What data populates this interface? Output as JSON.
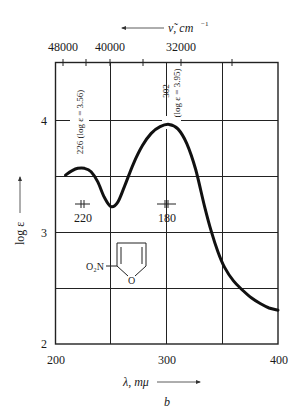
{
  "chart_data": {
    "type": "line",
    "title": "",
    "panel_label": "b",
    "xlabel": "λ, mμ",
    "ylabel": "log ε",
    "top_xlabel": "ν̃, cm⁻¹",
    "xlim": [
      200,
      400
    ],
    "ylim": [
      2,
      4.5
    ],
    "x_ticks": [
      200,
      300,
      400
    ],
    "x_gridlines": [
      250,
      300,
      350
    ],
    "y_ticks": [
      2,
      3,
      4
    ],
    "y_gridlines": [
      2.5,
      3,
      3.5,
      4
    ],
    "top_ticks_labeled": [
      {
        "label": "48000",
        "lambda": 208.3
      },
      {
        "label": "40000",
        "lambda": 250
      },
      {
        "label": "32000",
        "lambda": 312.5
      }
    ],
    "top_ticks_minor": [
      227.3,
      277.8,
      357.1
    ],
    "grid": true,
    "series": [
      {
        "name": "2-nitrofuran",
        "x": [
          209,
          215,
          220,
          226,
          232,
          238,
          244,
          250,
          256,
          262,
          270,
          278,
          286,
          294,
          302,
          310,
          318,
          326,
          334,
          340,
          346,
          352,
          360,
          368,
          376,
          384,
          392,
          400
        ],
        "y": [
          3.5,
          3.54,
          3.56,
          3.56,
          3.53,
          3.44,
          3.3,
          3.22,
          3.26,
          3.4,
          3.6,
          3.76,
          3.87,
          3.93,
          3.95,
          3.91,
          3.78,
          3.55,
          3.22,
          3.0,
          2.82,
          2.68,
          2.56,
          2.48,
          2.41,
          2.36,
          2.32,
          2.3
        ]
      }
    ],
    "annotations": [
      {
        "text": "226 (log ε = 3.56)",
        "x": 226,
        "y": 3.56,
        "rotation": -90
      },
      {
        "text": "302",
        "x": 302,
        "y": 3.95,
        "rotation": -90
      },
      {
        "text": "(log ε = 3.95)",
        "x": 302,
        "y": 3.95,
        "rotation": -90
      },
      {
        "text": "220",
        "x": 220,
        "y": 3.3,
        "note": "bandwidth marker"
      },
      {
        "text": "180",
        "x": 300,
        "y": 3.3,
        "note": "bandwidth marker"
      }
    ],
    "structure": {
      "substituent": "O₂N",
      "ring_atom": "O",
      "name": "2-nitrofuran"
    }
  },
  "labels": {
    "top_axis_title": "ν̃, cm",
    "top_axis_exp": "−1",
    "top_tick_48000": "48000",
    "top_tick_40000": "40000",
    "top_tick_32000": "32000",
    "y_tick_2": "2",
    "y_tick_3": "3",
    "y_tick_4": "4",
    "x_tick_200": "200",
    "x_tick_300": "300",
    "x_tick_400": "400",
    "ylabel": "log ε",
    "xlabel": "λ, mμ",
    "panel": "b",
    "ann_226": "226 (log ε = 3.56)",
    "ann_302": "302",
    "ann_302_log": "(log ε = 3.95)",
    "bw_220": "220",
    "bw_180": "180",
    "mol_sub": "O₂N",
    "mol_o": "O"
  }
}
